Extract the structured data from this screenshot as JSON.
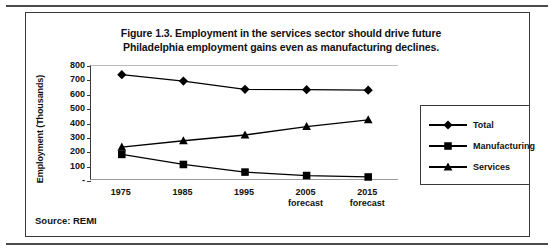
{
  "figure": {
    "title_line1": "Figure 1.3. Employment in the services sector should drive future",
    "title_line2": "Philadelphia employment gains even as manufacturing declines.",
    "source": "Source: REMI"
  },
  "chart_data": {
    "type": "line",
    "title": "Figure 1.3. Employment in the services sector should drive future Philadelphia employment gains even as manufacturing declines.",
    "xlabel": "",
    "ylabel": "Employment (Thousands)",
    "categories": [
      "1975",
      "1985",
      "1995",
      "2005 forecast",
      "2015 forecast"
    ],
    "category_lines": [
      [
        "1975",
        ""
      ],
      [
        "1985",
        ""
      ],
      [
        "1995",
        ""
      ],
      [
        "2005",
        "forecast"
      ],
      [
        "2015",
        "forecast"
      ]
    ],
    "series": [
      {
        "name": "Total",
        "marker": "diamond",
        "color": "#000000",
        "values": [
          740,
          695,
          638,
          635,
          632
        ]
      },
      {
        "name": "Manufacturing",
        "marker": "square",
        "color": "#000000",
        "values": [
          185,
          115,
          62,
          38,
          28
        ]
      },
      {
        "name": "Services",
        "marker": "triangle",
        "color": "#000000",
        "values": [
          235,
          280,
          320,
          378,
          425
        ]
      }
    ],
    "ylim": [
      0,
      800
    ],
    "ytick_values": [
      800,
      700,
      600,
      500,
      400,
      300,
      200,
      100,
      0
    ],
    "ytick_labels": [
      "800",
      "700",
      "600",
      "500",
      "400",
      "300",
      "200",
      "100",
      "-"
    ],
    "grid": false,
    "legend_position": "right"
  },
  "legend": {
    "entries": [
      {
        "label": "Total"
      },
      {
        "label": "Manufacturing"
      },
      {
        "label": "Services"
      }
    ]
  }
}
